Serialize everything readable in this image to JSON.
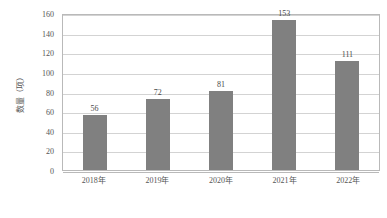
{
  "chart_data": {
    "type": "bar",
    "title": "",
    "subtitle": "",
    "xlabel": "",
    "ylabel": "数量（项）",
    "categories": [
      "2018年",
      "2019年",
      "2020年",
      "2021年",
      "2022年"
    ],
    "values": [
      56,
      72,
      81,
      153,
      111
    ],
    "data_labels": [
      "56",
      "72",
      "81",
      "153",
      "111"
    ],
    "ylim": [
      0,
      160
    ],
    "ytick_values": [
      0,
      20,
      40,
      60,
      80,
      100,
      120,
      140,
      160
    ],
    "ytick_labels": [
      "0",
      "20",
      "40",
      "60",
      "80",
      "100",
      "120",
      "140",
      "160"
    ],
    "grid": true,
    "grid_orientation": "horizontal",
    "legend": false,
    "legend_position": "none",
    "series": [
      {
        "name": "数量（项）",
        "values": [
          56,
          72,
          81,
          153,
          111
        ]
      }
    ],
    "colors": {
      "bar": "#808080",
      "gridline": "#d3d3d3",
      "axis": "#b9b9b9",
      "text": "#555555",
      "label": "#4a4a4a",
      "background": "#ffffff"
    }
  }
}
